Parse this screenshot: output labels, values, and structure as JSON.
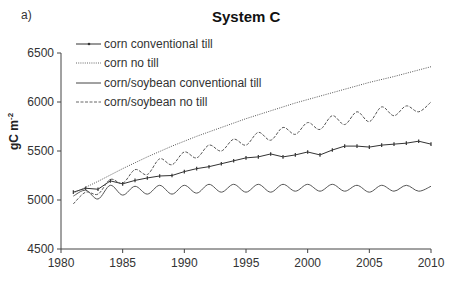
{
  "panel_label": "a)",
  "chart_data": {
    "type": "line",
    "title": "System C",
    "xlabel": "",
    "ylabel": "gC m-2",
    "ylabel_main": "gC m",
    "ylabel_sup": "-2",
    "xlim": [
      1980,
      2010
    ],
    "ylim": [
      4500,
      6500
    ],
    "x_ticks": [
      1980,
      1985,
      1990,
      1995,
      2000,
      2005,
      2010
    ],
    "y_ticks": [
      4500,
      5000,
      5500,
      6000,
      6500
    ],
    "grid": false,
    "legend_position": "upper left",
    "series": [
      {
        "name": "corn conventional till",
        "style": "solid-markers",
        "color": "#333333",
        "x": [
          1981,
          1982,
          1983,
          1984,
          1985,
          1986,
          1987,
          1988,
          1989,
          1990,
          1991,
          1992,
          1993,
          1994,
          1995,
          1996,
          1997,
          1998,
          1999,
          2000,
          2001,
          2002,
          2003,
          2004,
          2005,
          2006,
          2007,
          2008,
          2009,
          2010
        ],
        "values": [
          5080,
          5120,
          5110,
          5195,
          5165,
          5200,
          5225,
          5245,
          5250,
          5290,
          5320,
          5340,
          5370,
          5400,
          5430,
          5440,
          5470,
          5440,
          5460,
          5490,
          5460,
          5510,
          5550,
          5550,
          5540,
          5560,
          5570,
          5580,
          5600,
          5570
        ]
      },
      {
        "name": "corn no till",
        "style": "dotted",
        "color": "#555555",
        "x": [
          1981,
          1983,
          1985,
          1987,
          1989,
          1991,
          1993,
          1995,
          1997,
          1999,
          2001,
          2003,
          2005,
          2007,
          2010
        ],
        "values": [
          5070,
          5190,
          5320,
          5440,
          5550,
          5650,
          5740,
          5830,
          5910,
          5990,
          6060,
          6130,
          6200,
          6260,
          6360
        ]
      },
      {
        "name": "corn/soybean conventional till",
        "style": "solid",
        "color": "#555555",
        "x": [
          1981,
          1982,
          1983,
          1984,
          1985,
          1986,
          1987,
          1988,
          1989,
          1990,
          1991,
          1992,
          1993,
          1994,
          1995,
          1996,
          1997,
          1998,
          1999,
          2000,
          2001,
          2002,
          2003,
          2004,
          2005,
          2006,
          2007,
          2008,
          2009,
          2010
        ],
        "values": [
          5040,
          5100,
          5010,
          5150,
          5050,
          5140,
          5060,
          5150,
          5060,
          5150,
          5070,
          5160,
          5080,
          5160,
          5080,
          5160,
          5080,
          5160,
          5090,
          5160,
          5090,
          5160,
          5090,
          5150,
          5080,
          5150,
          5090,
          5150,
          5090,
          5140
        ]
      },
      {
        "name": "corn/soybean no till",
        "style": "dashed",
        "color": "#555555",
        "x": [
          1981,
          1982,
          1983,
          1984,
          1985,
          1986,
          1987,
          1988,
          1989,
          1990,
          1991,
          1992,
          1993,
          1994,
          1995,
          1996,
          1997,
          1998,
          1999,
          2000,
          2001,
          2002,
          2003,
          2004,
          2005,
          2006,
          2007,
          2008,
          2009,
          2010
        ],
        "values": [
          4960,
          5080,
          5060,
          5210,
          5170,
          5310,
          5260,
          5420,
          5360,
          5490,
          5430,
          5560,
          5500,
          5620,
          5560,
          5690,
          5610,
          5740,
          5670,
          5790,
          5720,
          5860,
          5770,
          5900,
          5800,
          5950,
          5860,
          5960,
          5900,
          6000
        ]
      }
    ]
  }
}
